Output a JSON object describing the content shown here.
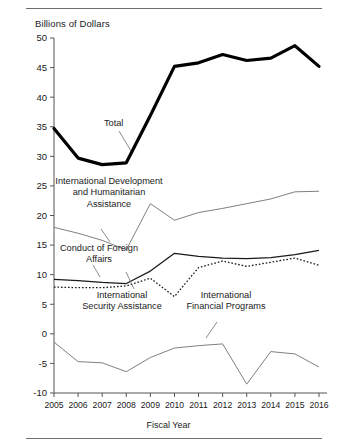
{
  "chart_data": {
    "type": "line",
    "title": "",
    "ylabel": "Billions of Dollars",
    "xlabel": "Fiscal Year",
    "categories": [
      2005,
      2006,
      2007,
      2008,
      2009,
      2010,
      2011,
      2012,
      2013,
      2014,
      2015,
      2016
    ],
    "x_tick_labels": [
      "2005",
      "2006",
      "2007",
      "2008",
      "2009",
      "2010",
      "2011",
      "2012",
      "2013",
      "2014",
      "2015",
      "2016"
    ],
    "y_tick_labels": [
      "50",
      "45",
      "40",
      "35",
      "30",
      "25",
      "20",
      "15",
      "10",
      "5",
      "0",
      "-5",
      "-10"
    ],
    "ylim": [
      -10,
      50
    ],
    "ytick_step": 5,
    "grid": false,
    "legend": "inline-annotations",
    "series": [
      {
        "name": "Total",
        "style": "thick-solid-black",
        "color": "#000000",
        "values": [
          34.7,
          29.7,
          28.6,
          28.9,
          36.9,
          45.2,
          45.8,
          47.2,
          46.2,
          46.6,
          48.7,
          45.2
        ]
      },
      {
        "name": "International Development and Humanitarian Assistance",
        "style": "thin-solid-gray",
        "color": "#707070",
        "values": [
          18.0,
          17.0,
          15.8,
          14.2,
          22.0,
          19.2,
          20.5,
          21.2,
          22.0,
          22.8,
          24.0,
          24.1
        ]
      },
      {
        "name": "Conduct of Foreign Affairs",
        "style": "medium-solid-black",
        "color": "#1a1a1a",
        "values": [
          9.2,
          9.0,
          8.7,
          8.5,
          10.6,
          13.6,
          13.1,
          12.8,
          12.7,
          12.9,
          13.4,
          14.1
        ]
      },
      {
        "name": "International Security Assistance",
        "style": "dotted-black",
        "color": "#1a1a1a",
        "values": [
          7.9,
          7.8,
          7.8,
          8.1,
          9.4,
          6.3,
          11.2,
          12.3,
          11.4,
          12.1,
          12.8,
          11.6
        ]
      },
      {
        "name": "International Financial Programs",
        "style": "thin-solid-gray",
        "color": "#707070",
        "values": [
          -1.4,
          -4.7,
          -4.9,
          -6.4,
          -4.0,
          -2.4,
          -2.0,
          -1.7,
          -8.5,
          -3.0,
          -3.4,
          -5.6
        ]
      }
    ],
    "annotations": [
      {
        "label": "Total",
        "series": "Total"
      },
      {
        "label": "International Development and Humanitarian Assistance",
        "series": "International Development and Humanitarian Assistance"
      },
      {
        "label": "Conduct of Foreign Affairs",
        "series": "Conduct of Foreign Affairs"
      },
      {
        "label": "International Security Assistance",
        "series": "International Security Assistance"
      },
      {
        "label": "International Financial Programs",
        "series": "International Financial Programs"
      }
    ]
  },
  "axes": {
    "y_title": "Billions of Dollars",
    "x_title": "Fiscal Year"
  },
  "annotation_text": {
    "total": "Total",
    "development": "International Development and Humanitarian Assistance",
    "conduct": "Conduct of Foreign Affairs",
    "security": "International Security Assistance",
    "financial": "International Financial Programs"
  }
}
